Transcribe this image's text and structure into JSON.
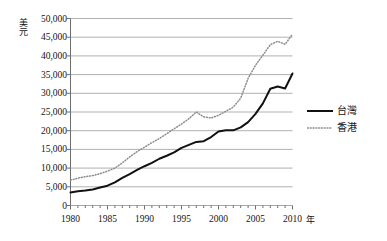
{
  "chart_data": {
    "type": "line",
    "title": "",
    "xlabel": "年",
    "ylabel": "美元",
    "xlim": [
      1980,
      2010
    ],
    "ylim": [
      0,
      50000
    ],
    "grid": true,
    "legend_position": "right",
    "y_ticks": [
      0,
      5000,
      10000,
      15000,
      20000,
      25000,
      30000,
      35000,
      40000,
      45000,
      50000
    ],
    "y_tick_labels": [
      "0",
      "5,000",
      "10,000",
      "15,000",
      "20,000",
      "25,000",
      "30,000",
      "35,000",
      "40,000",
      "45,000",
      "50,000"
    ],
    "x_ticks": [
      1980,
      1985,
      1990,
      1995,
      2000,
      2005,
      2010
    ],
    "x_tick_labels": [
      "1980",
      "1985",
      "1990",
      "1995",
      "2000",
      "2005",
      "2010"
    ],
    "x_minor_tick_interval": 1,
    "x": [
      1980,
      1981,
      1982,
      1983,
      1984,
      1985,
      1986,
      1987,
      1988,
      1989,
      1990,
      1991,
      1992,
      1993,
      1994,
      1995,
      1996,
      1997,
      1998,
      1999,
      2000,
      2001,
      2002,
      2003,
      2004,
      2005,
      2006,
      2007,
      2008,
      2009,
      2010
    ],
    "series": [
      {
        "name": "台灣",
        "style": "solid",
        "color": "#111111",
        "values": [
          3500,
          3800,
          4000,
          4300,
          4800,
          5300,
          6200,
          7400,
          8400,
          9500,
          10500,
          11400,
          12500,
          13300,
          14200,
          15400,
          16200,
          17000,
          17200,
          18300,
          19800,
          20100,
          20100,
          20900,
          22300,
          24500,
          27300,
          31200,
          31800,
          31300,
          35300
        ]
      },
      {
        "name": "香港",
        "style": "dotted",
        "color": "#8c8c8c",
        "values": [
          6800,
          7300,
          7700,
          8000,
          8500,
          9200,
          10000,
          11400,
          13000,
          14400,
          15600,
          16800,
          17900,
          19200,
          20500,
          21800,
          23200,
          25000,
          23700,
          23400,
          24100,
          25200,
          26300,
          28700,
          34000,
          37500,
          40200,
          43000,
          43900,
          43100,
          45800
        ]
      }
    ]
  },
  "legend": {
    "items": [
      {
        "label": "台灣",
        "style": "solid"
      },
      {
        "label": "香港",
        "style": "dotted"
      }
    ]
  },
  "axis_titles": {
    "y": "美元",
    "x": "年"
  },
  "colors": {
    "taiwan_line": "#111111",
    "hongkong_line": "#8c8c8c",
    "gridline": "#a8a8a8",
    "axis": "#6e6e6e",
    "text": "#141414"
  }
}
